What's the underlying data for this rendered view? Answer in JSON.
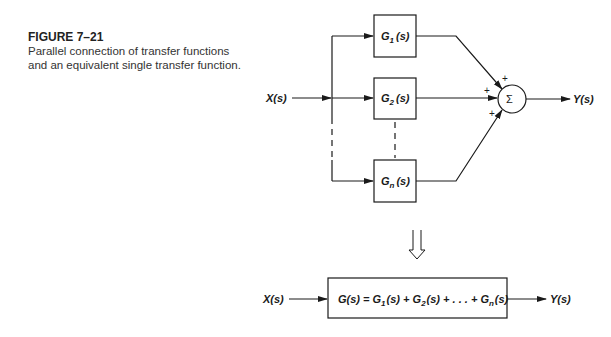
{
  "caption": {
    "figure_label": "FIGURE 7–21",
    "description": "Parallel connection of transfer functions and an equivalent single transfer function."
  },
  "top_diagram": {
    "input_label": "X(s)",
    "output_label": "Y(s)",
    "blocks": [
      {
        "main": "G",
        "sub": "1",
        "arg": "(s)"
      },
      {
        "main": "G",
        "sub": "2",
        "arg": "(s)"
      },
      {
        "main": "G",
        "sub": "n",
        "arg": "(s)"
      }
    ],
    "summing_junction": {
      "symbol": "Σ",
      "signs": [
        "+",
        "+",
        "+"
      ]
    }
  },
  "equivalence_arrow": "⇩",
  "bottom_diagram": {
    "input_label": "X(s)",
    "output_label": "Y(s)",
    "equation": {
      "lhs": "G(s) = ",
      "terms": [
        {
          "main": "G",
          "sub": "1",
          "arg": "(s)"
        },
        {
          "main": "G",
          "sub": "2",
          "arg": "(s)"
        },
        {
          "main": "G",
          "sub": "n",
          "arg": "(s)"
        }
      ],
      "plus": " + ",
      "ellipsis": " + . . . + "
    }
  }
}
